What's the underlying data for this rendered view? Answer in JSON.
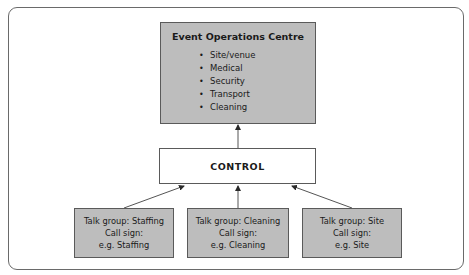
{
  "diagram": {
    "eoc": {
      "title": "Event Operations Centre",
      "items": [
        "Site/venue",
        "Medical",
        "Security",
        "Transport",
        "Cleaning"
      ]
    },
    "control": {
      "label": "CONTROL"
    },
    "talk_groups": [
      {
        "line1": "Talk group: Staffing",
        "line2": "Call sign:",
        "line3": "e.g. Staffing"
      },
      {
        "line1": "Talk group: Cleaning",
        "line2": "Call sign:",
        "line3": "e.g. Cleaning"
      },
      {
        "line1": "Talk group: Site",
        "line2": "Call sign:",
        "line3": "e.g. Site"
      }
    ],
    "colors": {
      "box_fill": "#bdbdbd",
      "border": "#5a5a5a",
      "frame": "#6a6a6a"
    }
  }
}
